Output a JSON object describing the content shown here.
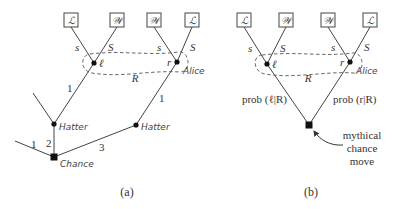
{
  "panel_a": {
    "caption": "(a)",
    "payoff_boxes": [
      "ℒ",
      "𝒲",
      "𝒲",
      "ℒ"
    ],
    "left_node_label": "ℓ",
    "right_node_label": "r",
    "left_branch_labels": {
      "left": "s",
      "right": "S"
    },
    "right_branch_labels": {
      "left": "s",
      "right": "S"
    },
    "info_set_label": "R",
    "info_set_player": "Alice",
    "hatter_left": "Hatter",
    "hatter_right": "Hatter",
    "chance": "Chance",
    "edge_labels": {
      "hatter_left_to_l": "1",
      "hatter_right_to_r": "1",
      "chance_left": "1",
      "chance_mid": "2",
      "chance_right": "3"
    }
  },
  "panel_b": {
    "caption": "(b)",
    "payoff_boxes": [
      "ℒ",
      "𝒲",
      "𝒲",
      "ℒ"
    ],
    "left_node_label": "ℓ",
    "right_node_label": "r",
    "left_branch_labels": {
      "left": "s",
      "right": "S"
    },
    "right_branch_labels": {
      "left": "s",
      "right": "S"
    },
    "info_set_label": "R",
    "info_set_player": "Alice",
    "prob_left": "prob (ℓ|R)",
    "prob_right": "prob (r|R)",
    "annotation_lines": [
      "mythical",
      "chance",
      "move"
    ]
  }
}
